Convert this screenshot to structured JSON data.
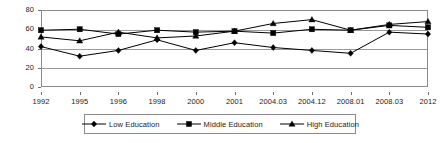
{
  "chart_data": {
    "type": "line",
    "title": "",
    "subtitle": "",
    "xlabel": "",
    "ylabel": "",
    "categories": [
      "1992",
      "1995",
      "1996",
      "1998",
      "2000",
      "2001",
      "2004.03",
      "2004.12",
      "2008.01",
      "2008.03",
      "2012"
    ],
    "ylim": [
      0,
      80
    ],
    "yticks": [
      0,
      20,
      40,
      60,
      80
    ],
    "ytick_labels": [
      "0",
      "20",
      "40",
      "60",
      "80"
    ],
    "grid": true,
    "legend_position": "bottom",
    "series": [
      {
        "name": "Low Education",
        "marker": "diamond",
        "color": "#000000",
        "values": [
          42,
          32,
          38,
          49,
          38,
          46,
          41,
          38,
          35,
          57,
          55
        ]
      },
      {
        "name": "Middle Education",
        "marker": "square",
        "color": "#000000",
        "values": [
          59,
          60,
          55,
          59,
          57,
          58,
          56,
          60,
          59,
          64,
          62
        ]
      },
      {
        "name": "High Education",
        "marker": "triangle",
        "color": "#000000",
        "values": [
          52,
          48,
          57,
          51,
          53,
          58,
          66,
          70,
          59,
          65,
          68
        ]
      }
    ]
  },
  "legend": {
    "entries": [
      {
        "label": "Low Education",
        "marker": "diamond"
      },
      {
        "label": "Middle Education",
        "marker": "square"
      },
      {
        "label": "High Education",
        "marker": "triangle"
      }
    ]
  },
  "axes": {
    "y_title": "",
    "x_title": ""
  }
}
